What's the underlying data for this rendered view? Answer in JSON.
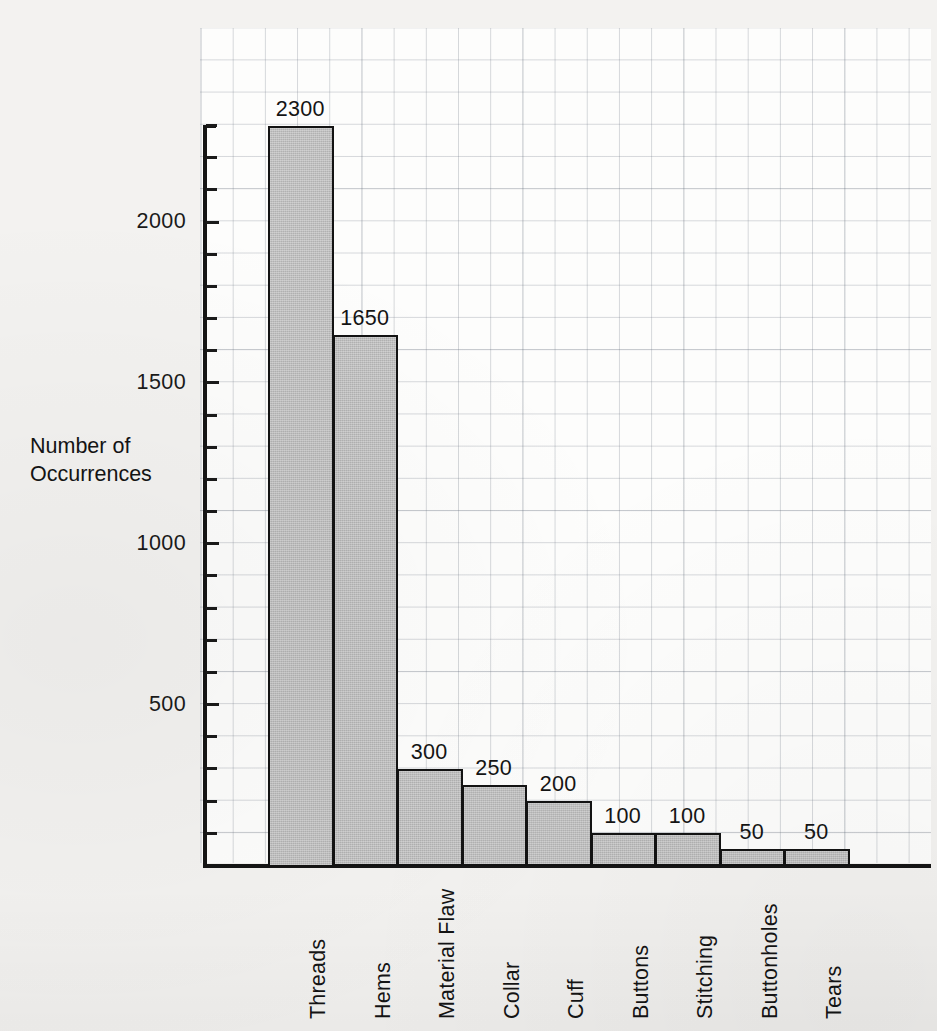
{
  "chart_data": {
    "type": "bar",
    "title": "",
    "subtitle": "",
    "xlabel": "",
    "ylabel": "Number of\nOccurrences",
    "ylabel_line1": "Number of",
    "ylabel_line2": "Occurrences",
    "categories": [
      "Threads",
      "Hems",
      "Material Flaw",
      "Collar",
      "Cuff",
      "Buttons",
      "Stitching",
      "Buttonholes",
      "Tears"
    ],
    "values": [
      2300,
      1650,
      300,
      250,
      200,
      100,
      100,
      50,
      50
    ],
    "value_labels": [
      "2300",
      "1650",
      "300",
      "250",
      "200",
      "100",
      "100",
      "50",
      "50"
    ],
    "ylim": [
      0,
      2300
    ],
    "y_tick_labels": [
      "500",
      "1000",
      "1500",
      "2000"
    ],
    "y_tick_values": [
      500,
      1000,
      1500,
      2000
    ],
    "y_minor_tick_step": 100,
    "grid": true,
    "legend": "none",
    "bar_fill_color": "#b9b9b9",
    "bar_edge_color": "#131313",
    "grid_color": "#7b848f",
    "background_color": "#f3f2f0",
    "axis_color": "#151515",
    "text_color": "#141414"
  }
}
